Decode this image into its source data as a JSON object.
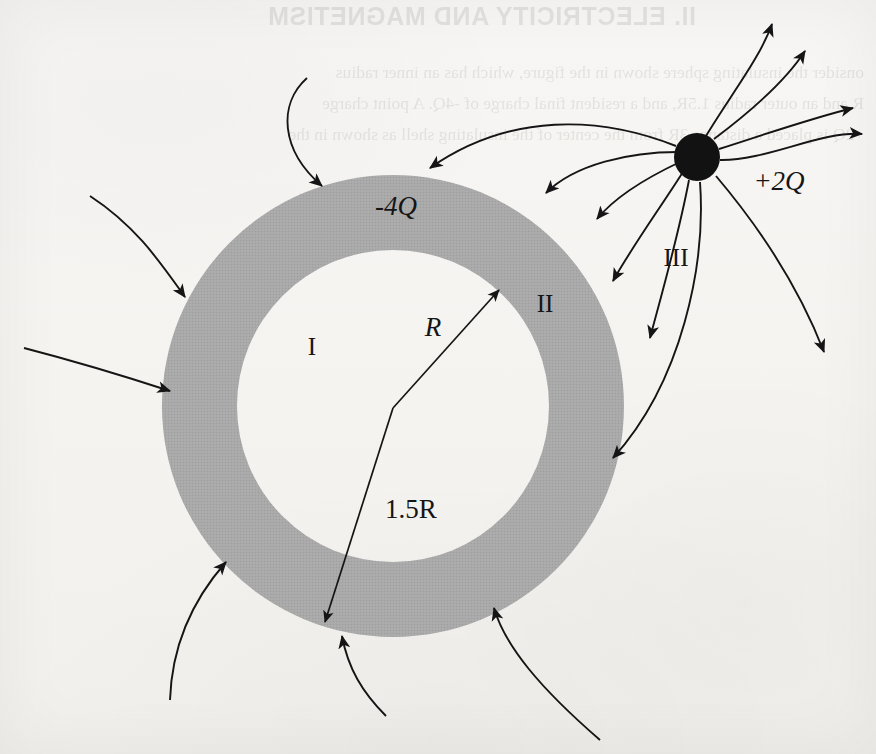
{
  "page": {
    "background_color": "#f6f5f3",
    "ink_color": "#1a1a1a"
  },
  "bleed_through": {
    "note": "faint mirrored text showing through from the reverse side of the printed page",
    "title": "II. ELECTRICITY AND MAGNETISM",
    "lines": [
      "onsider the insulating sphere shown in the figure, which has an inner radius",
      "R and an outer radius 1.5R, and a resident final charge of -4Q. A point charge",
      "+2Q is placed a distance 3R from the center of the insulating shell as shown in the",
      "figure."
    ],
    "caption_lines": [
      "Insulating shell",
      "with charge -4Q"
    ]
  },
  "diagram": {
    "type": "electrostatics-field-diagram",
    "shell": {
      "label": "-4Q",
      "inner_radius_label": "R",
      "outer_radius_label": "1.5R",
      "fill_color": "#a9a9a9",
      "center_x": 393,
      "center_y": 406,
      "inner_radius_px": 156,
      "outer_radius_px": 231
    },
    "point_charge": {
      "label": "+2Q",
      "fill_color": "#111111",
      "center_x": 697,
      "center_y": 157,
      "radius_px": 23
    },
    "regions": [
      {
        "name": "region-I",
        "label": "I",
        "x": 312,
        "y": 347,
        "description": "inside the hollow cavity"
      },
      {
        "name": "region-II",
        "label": "II",
        "x": 545,
        "y": 302,
        "description": "within the insulating shell material"
      },
      {
        "name": "region-III",
        "label": "III",
        "x": 676,
        "y": 256,
        "description": "outside the shell"
      }
    ],
    "field_lines": {
      "inward_arrow_count": 12,
      "outward_arrow_count": 5,
      "description": "field lines from the +2Q point charge terminating on the negatively charged shell, plus lines radiating outward to infinity"
    }
  }
}
